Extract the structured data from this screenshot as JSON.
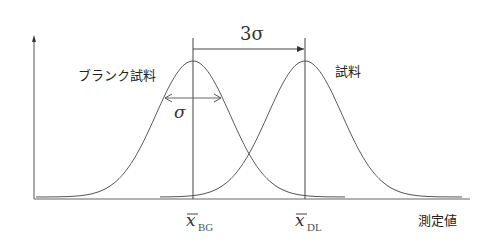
{
  "diagram": {
    "title": "",
    "labels": {
      "blank_sample": "ブランク試料",
      "sample": "試料",
      "three_sigma": "3σ",
      "sigma": "σ",
      "mean_bg_symbol": "x",
      "mean_bg_subscript": "BG",
      "mean_dl_symbol": "x",
      "mean_dl_subscript": "DL",
      "x_axis": "測定値"
    },
    "curves": [
      {
        "name": "blank-sample-distribution",
        "mean_px": 193,
        "sigma_px": 37
      },
      {
        "name": "sample-distribution",
        "mean_px": 305,
        "sigma_px": 37
      }
    ],
    "colors": {
      "line": "#444444",
      "text": "#222222",
      "background": "#ffffff"
    }
  }
}
